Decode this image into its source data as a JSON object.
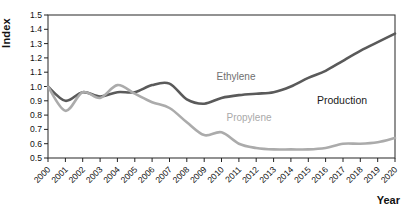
{
  "figure": {
    "background": "#ffffff",
    "frame_color": "#3a3a3a",
    "tick_color": "#222222",
    "tick_label_color": "#111111"
  },
  "chart_data": {
    "type": "line",
    "title": "",
    "xlabel": "Year",
    "ylabel": "Index",
    "x": [
      2000,
      2001,
      2002,
      2003,
      2004,
      2005,
      2006,
      2007,
      2008,
      2009,
      2010,
      2011,
      2012,
      2013,
      2014,
      2015,
      2016,
      2017,
      2018,
      2019,
      2020
    ],
    "series": [
      {
        "name": "Ethylene",
        "color": "#5a5a5a",
        "values": [
          1.0,
          0.9,
          0.96,
          0.93,
          0.96,
          0.96,
          1.01,
          1.02,
          0.91,
          0.88,
          0.92,
          0.94,
          0.95,
          0.96,
          1.0,
          1.06,
          1.11,
          1.18,
          1.25,
          1.31,
          1.37
        ]
      },
      {
        "name": "Propylene",
        "color": "#ababab",
        "values": [
          1.0,
          0.83,
          0.96,
          0.92,
          1.01,
          0.95,
          0.89,
          0.85,
          0.75,
          0.66,
          0.68,
          0.6,
          0.57,
          0.56,
          0.56,
          0.56,
          0.57,
          0.6,
          0.6,
          0.61,
          0.64
        ]
      }
    ],
    "ylim": [
      0.5,
      1.5
    ],
    "ytick_step": 0.1,
    "grid": false,
    "legend_position": "inline-labels",
    "annotations": [
      {
        "text": "Ethylene",
        "x": 236,
        "y": 76,
        "color": "#6f6f6f",
        "size": 10
      },
      {
        "text": "Propylene",
        "x": 249,
        "y": 117,
        "color": "#a9a9a9",
        "size": 10
      },
      {
        "text": "Production",
        "x": 342,
        "y": 100,
        "color": "#1a1a1a",
        "size": 10.5
      }
    ]
  }
}
